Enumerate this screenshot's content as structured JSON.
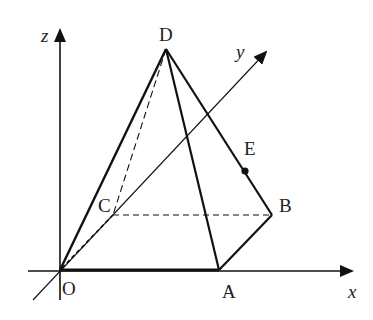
{
  "diagram": {
    "type": "3d-pyramid-coordinate-figure",
    "axes": {
      "x": {
        "label": "x",
        "from": [
          30,
          271
        ],
        "to": [
          352,
          271
        ]
      },
      "y": {
        "label": "y",
        "from": [
          35,
          298
        ],
        "to": [
          265,
          52
        ]
      },
      "z": {
        "label": "z",
        "from": [
          60,
          300
        ],
        "to": [
          60,
          27
        ]
      }
    },
    "points": {
      "O": {
        "label": "O",
        "xy": [
          60,
          270
        ]
      },
      "A": {
        "label": "A",
        "xy": [
          219,
          270
        ]
      },
      "B": {
        "label": "B",
        "xy": [
          272,
          215
        ]
      },
      "C": {
        "label": "C",
        "xy": [
          113,
          215
        ]
      },
      "D": {
        "label": "D",
        "xy": [
          166,
          49
        ]
      },
      "E": {
        "label": "E",
        "xy": [
          245,
          171
        ]
      }
    },
    "solid_edges": [
      "OA",
      "AB",
      "DO",
      "DA",
      "DB"
    ],
    "dashed_edges": [
      "OC",
      "CB",
      "DC"
    ],
    "marked_point": "E",
    "colors": {
      "line": "#111111",
      "background": "#ffffff"
    }
  }
}
